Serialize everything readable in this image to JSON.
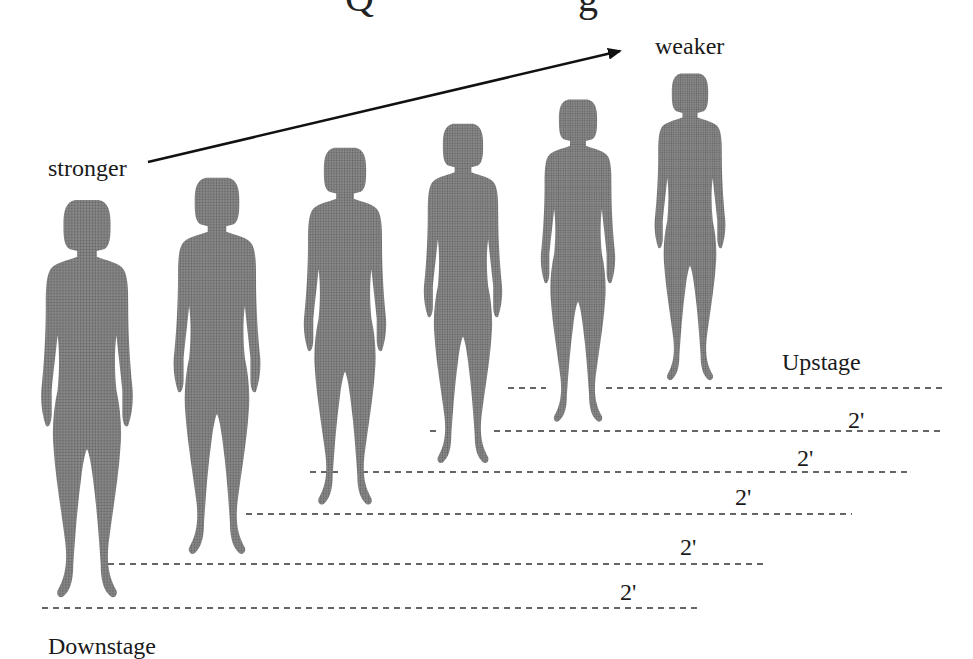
{
  "diagram": {
    "title_partial": "Q … g",
    "labels": {
      "stronger": "stronger",
      "weaker": "weaker",
      "upstage": "Upstage",
      "downstage": "Downstage"
    },
    "distance_labels": [
      "2'",
      "2'",
      "2'",
      "2'",
      "2'"
    ],
    "figure_count": 6,
    "figure_color": "#7a7a7a",
    "line_color": "#333333",
    "arrow_color": "#111111"
  }
}
